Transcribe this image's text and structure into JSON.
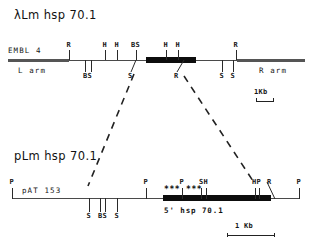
{
  "figure": {
    "type": "restriction-map",
    "panels": [
      {
        "id": "lambda",
        "title": "λLm hsp 70.1",
        "vector_label": "EMBL 4",
        "left_arm_label": "L arm",
        "right_arm_label": "R arm",
        "scale_label": "1Kb",
        "sites_above": [
          {
            "label": "R",
            "x": 69
          },
          {
            "label": "H",
            "x": 105
          },
          {
            "label": "H",
            "x": 117
          },
          {
            "label": "BS",
            "x": 136
          },
          {
            "label": "H",
            "x": 166
          },
          {
            "label": "H",
            "x": 178
          },
          {
            "label": "R",
            "x": 236
          }
        ],
        "sites_below": [
          {
            "label": "BS",
            "x": 87
          },
          {
            "label": "S",
            "x": 134
          },
          {
            "label": "R",
            "x": 179
          },
          {
            "label": "S",
            "x": 222
          },
          {
            "label": "S",
            "x": 233
          }
        ]
      },
      {
        "id": "plasmid",
        "title": "pLm hsp 70.1",
        "vector_label": "pAT 153",
        "insert_label": "5'    hsp 70.1",
        "scale_label": "1 Kb",
        "sites_above": [
          {
            "label": "P",
            "x": 12
          },
          {
            "label": "P",
            "x": 146
          },
          {
            "label": "P",
            "x": 182
          },
          {
            "label": "SH",
            "x": 203
          },
          {
            "label": "HP",
            "x": 256
          },
          {
            "label": "R",
            "x": 270
          },
          {
            "label": "P",
            "x": 299
          }
        ],
        "sites_below": [
          {
            "label": "S",
            "x": 89
          },
          {
            "label": "BS",
            "x": 102
          },
          {
            "label": "S",
            "x": 117
          }
        ],
        "star_groups": [
          "***",
          "***"
        ]
      }
    ],
    "connector": {
      "type": "dashed",
      "lines": 2
    }
  },
  "colors": {
    "ink": "#161616",
    "backbone": "#4a4a4a",
    "insert": "#0d0d0d",
    "background": "#ffffff"
  }
}
